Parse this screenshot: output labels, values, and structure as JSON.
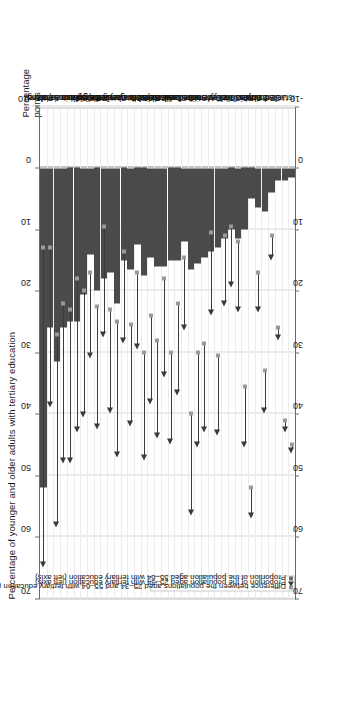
{
  "figure": {
    "title": "Percentage of younger and older adults with tertiary education",
    "right_axis_title": "Percentage points"
  },
  "legend": {
    "items": [
      {
        "marker": "square-grey",
        "label": "Difference between the populations aged 25–34 and 55–64 with tertiary education (right axis)"
      },
      {
        "marker": "triangle-dark",
        "label": "Proportion of the population aged 25–34 with tertiary education (left axis)"
      },
      {
        "marker": "square-dark",
        "label": "Proportion of the population aged 55–64 with tertiary education (left axis)"
      }
    ]
  },
  "axis": {
    "ticks": [
      70,
      60,
      50,
      40,
      30,
      20,
      10,
      0,
      -10
    ],
    "min": -10,
    "max": 70
  },
  "chart_data": {
    "type": "bar",
    "title": "Percentage of younger and older adults with tertiary education",
    "xlabel": "",
    "ylabel": "Percentage points",
    "ylim": [
      -10,
      70
    ],
    "grid": true,
    "legend_position": "inside-left",
    "categories": [
      "Korea",
      "Poland",
      "Japan",
      "Ireland",
      "Luxembourg",
      "France",
      "Spain",
      "Slovenia",
      "Belgium",
      "Portugal",
      "Latvia",
      "United Kingdom",
      "Czech Republic",
      "Netherlands",
      "Hungary",
      "Norway",
      "OECD average",
      "Sweden",
      "Greece",
      "Australia",
      "Iceland",
      "Slovak Republic",
      "Canada",
      "New Zealand",
      "Switzerland",
      "Mexico",
      "Denmark",
      "Italy",
      "Turkey",
      "Chile",
      "Finland",
      "Russian Federation",
      "Austria",
      "Estonia",
      "Brazil",
      "Germany",
      "United States",
      "Israel"
    ],
    "series": [
      {
        "name": "Proportion of the population aged 55-64 with tertiary education (left axis)",
        "marker": "square-dark",
        "values": [
          13.0,
          13.0,
          27.0,
          22.0,
          23.0,
          18.0,
          20.0,
          17.0,
          22.5,
          9.5,
          23.0,
          25.0,
          13.5,
          25.5,
          17.0,
          30.0,
          24.0,
          28.0,
          18.0,
          30.0,
          22.0,
          14.5,
          40.0,
          30.0,
          28.5,
          10.5,
          30.5,
          11.0,
          9.5,
          12.0,
          35.5,
          52.0,
          17.0,
          33.0,
          11.0,
          26.0,
          41.0,
          45.0
        ]
      },
      {
        "name": "Proportion of the population aged 25-34 with tertiary education (left axis)",
        "marker": "triangle-dark",
        "values": [
          65.0,
          39.0,
          58.5,
          48.0,
          48.0,
          43.0,
          40.5,
          31.0,
          42.5,
          27.5,
          40.0,
          47.0,
          28.5,
          42.0,
          29.5,
          47.5,
          38.5,
          44.0,
          34.0,
          45.0,
          37.0,
          26.5,
          56.5,
          45.5,
          43.0,
          24.0,
          43.5,
          22.5,
          19.5,
          23.5,
          45.5,
          57.0,
          23.5,
          40.0,
          15.0,
          28.0,
          43.0,
          46.5
        ]
      },
      {
        "name": "Difference between the populations aged 25-34 and 55-64 with tertiary education (right axis)",
        "marker": "square-grey",
        "values": [
          52.0,
          26.0,
          31.5,
          26.0,
          25.0,
          25.0,
          20.5,
          14.0,
          20.0,
          18.0,
          17.0,
          22.0,
          15.0,
          16.5,
          12.5,
          17.5,
          14.5,
          16.0,
          16.0,
          15.0,
          15.0,
          12.0,
          16.5,
          15.5,
          14.5,
          13.5,
          13.0,
          11.5,
          10.0,
          11.5,
          10.0,
          5.0,
          6.5,
          7.0,
          4.0,
          2.0,
          2.0,
          1.5
        ]
      }
    ]
  }
}
